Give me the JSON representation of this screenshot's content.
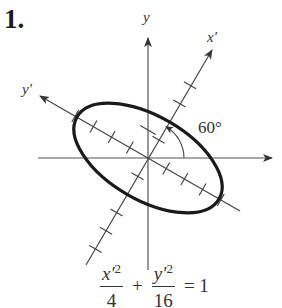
{
  "problem": {
    "number": "1."
  },
  "diagram": {
    "axes": {
      "x_label": "",
      "y_label": "y",
      "x_prime_label": "x′",
      "y_prime_label": "y′"
    },
    "rotation_angle_label": "60°",
    "rotation_angle_degrees": 60,
    "ellipse": {
      "semi_axis_x_prime": 2,
      "semi_axis_y_prime": 4
    },
    "colors": {
      "ink": "#333333",
      "curve": "#1a1a1a"
    }
  },
  "equation": {
    "term1_numerator": "x′",
    "term1_exponent": "2",
    "term1_denominator": "4",
    "plus": "+",
    "term2_numerator": "y′",
    "term2_exponent": "2",
    "term2_denominator": "16",
    "equals": "= 1"
  }
}
